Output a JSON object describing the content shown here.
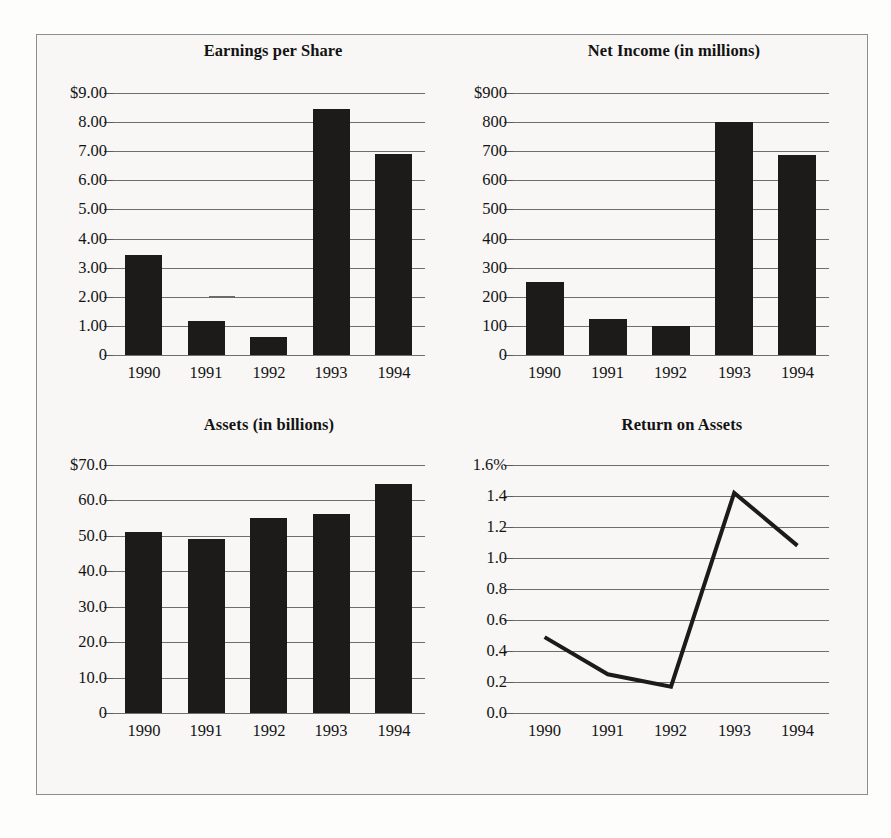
{
  "figure": {
    "background_color": "#f8f7f5",
    "border_color": "#8e8e8e",
    "bar_color": "#1c1b1a",
    "gridline_color": "#6e6e6e"
  },
  "chart_data": [
    {
      "type": "bar",
      "id": "earnings-per-share",
      "title": "Earnings per Share",
      "xlabel": "",
      "ylabel": "",
      "categories": [
        "1990",
        "1991",
        "1992",
        "1993",
        "1994"
      ],
      "values": [
        3.45,
        1.18,
        0.62,
        8.45,
        6.9
      ],
      "ylim": [
        0,
        9
      ],
      "yticks": [
        0,
        1,
        2,
        3,
        4,
        5,
        6,
        7,
        8,
        9
      ],
      "ytick_labels": [
        "0",
        "1.00",
        "2.00",
        "3.00",
        "4.00",
        "5.00",
        "6.00",
        "7.00",
        "8.00",
        "$9.00"
      ],
      "grid": true,
      "legend": "none"
    },
    {
      "type": "bar",
      "id": "net-income",
      "title": "Net Income (in millions)",
      "xlabel": "",
      "ylabel": "",
      "categories": [
        "1990",
        "1991",
        "1992",
        "1993",
        "1994"
      ],
      "values": [
        250,
        122,
        98,
        800,
        688
      ],
      "ylim": [
        0,
        900
      ],
      "yticks": [
        0,
        100,
        200,
        300,
        400,
        500,
        600,
        700,
        800,
        900
      ],
      "ytick_labels": [
        "0",
        "100",
        "200",
        "300",
        "400",
        "500",
        "600",
        "700",
        "800",
        "$900"
      ],
      "grid": true,
      "legend": "none"
    },
    {
      "type": "bar",
      "id": "assets",
      "title": "Assets (in billions)",
      "xlabel": "",
      "ylabel": "",
      "categories": [
        "1990",
        "1991",
        "1992",
        "1993",
        "1994"
      ],
      "values": [
        51.2,
        49.2,
        55.0,
        56.2,
        64.5
      ],
      "ylim": [
        0,
        70
      ],
      "yticks": [
        0,
        10,
        20,
        30,
        40,
        50,
        60,
        70
      ],
      "ytick_labels": [
        "0",
        "10.0",
        "20.0",
        "30.0",
        "40.0",
        "50.0",
        "60.0",
        "$70.0"
      ],
      "grid": true,
      "legend": "none"
    },
    {
      "type": "line",
      "id": "return-on-assets",
      "title": "Return on Assets",
      "xlabel": "",
      "ylabel": "",
      "categories": [
        "1990",
        "1991",
        "1992",
        "1993",
        "1994"
      ],
      "values": [
        0.49,
        0.25,
        0.17,
        1.42,
        1.08
      ],
      "ylim": [
        0,
        1.6
      ],
      "yticks": [
        0.0,
        0.2,
        0.4,
        0.6,
        0.8,
        1.0,
        1.2,
        1.4,
        1.6
      ],
      "ytick_labels": [
        "0.0",
        "0.2",
        "0.4",
        "0.6",
        "0.8",
        "1.0",
        "1.2",
        "1.4",
        "1.6%"
      ],
      "grid": true,
      "legend": "none",
      "line_color": "#1c1b1a"
    }
  ]
}
